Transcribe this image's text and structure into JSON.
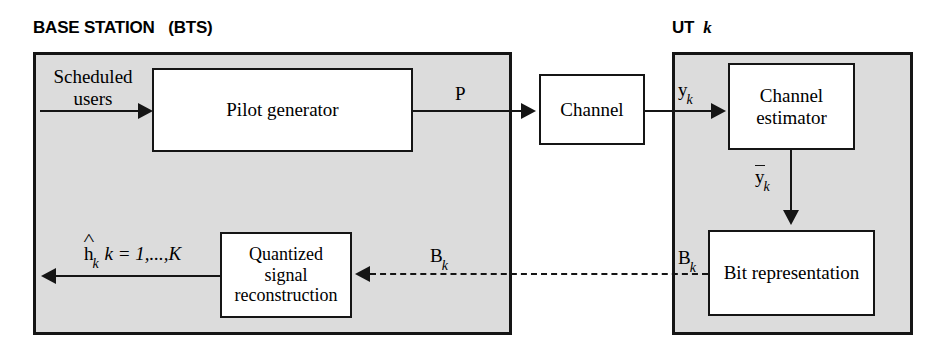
{
  "diagram": {
    "title_bts": "BASE STATION   (BTS)",
    "title_ut_prefix": "UT  ",
    "title_ut_index": "k",
    "blocks": {
      "pilot_generator": "Pilot generator",
      "channel": "Channel",
      "channel_estimator_line1": "Channel",
      "channel_estimator_line2": "estimator",
      "bit_representation": "Bit representation",
      "quantized_line1": "Quantized",
      "quantized_line2": "signal",
      "quantized_line3": "reconstruction"
    },
    "signals": {
      "scheduled_line1": "Scheduled",
      "scheduled_line2": "users",
      "pilot_matrix": "P",
      "received_y": "y",
      "received_y_sub": "k",
      "quantized_y": "y",
      "quantized_y_sub": "k",
      "bits_bts": "B",
      "bits_bts_sub": "k",
      "bits_ut": "B",
      "bits_ut_sub": "k",
      "estimate_symbol": "h",
      "estimate_sub": "k",
      "estimate_range": " k = 1,...,K"
    },
    "colors": {
      "container_fill": "#dcdcdc",
      "block_fill": "#ffffff",
      "stroke": "#151515",
      "page_background": "#ffffff"
    }
  }
}
